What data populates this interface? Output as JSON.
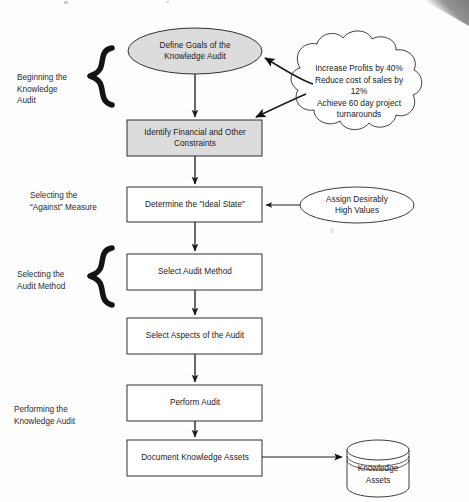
{
  "diagram": {
    "nodes": {
      "define_goals": "Define Goals of the\nKnowledge Audit",
      "identify_constraints": "Identify Financial and Other\nConstraints",
      "determine_ideal_state": "Determine the \"Ideal State\"",
      "select_audit_method": "Select Audit Method",
      "select_aspects": "Select Aspects of the Audit",
      "perform_audit": "Perform Audit",
      "document_assets": "Document Knowledge Assets"
    },
    "cloud": {
      "line1": "Increase Profits by 40%",
      "line2": "Reduce cost of sales by",
      "line3": "12%",
      "line4": "Achieve 60 day project",
      "line5": "turnarounds"
    },
    "assign_values_ellipse": {
      "line1": "Assign Desirably",
      "line2": "High Values"
    },
    "data_store": {
      "line1": "Knowledge",
      "line2": "Assets"
    },
    "stage_labels": [
      {
        "id": "beginning",
        "line1": "Beginning the",
        "line2": "Knowledge",
        "line3": "Audit"
      },
      {
        "id": "against-measure",
        "line1": "Selecting the",
        "line2": "“Against” Measure",
        "line3": ""
      },
      {
        "id": "audit-method",
        "line1": "Selecting the",
        "line2": "Audit Method",
        "line3": ""
      },
      {
        "id": "performing",
        "line1": "Performing the",
        "line2": "Knowledge Audit",
        "line3": ""
      }
    ],
    "colors": {
      "shape_fill_shaded": "#dcdcdc",
      "shape_fill_plain": "#ffffff",
      "stroke": "#1a1a1a",
      "brace": "#141414",
      "artifact": "#7a7a7a"
    },
    "icons": {
      "brace": "curly-brace-icon",
      "cloud": "cloud-icon",
      "cylinder": "database-cylinder-icon",
      "arrow": "arrow-icon"
    }
  }
}
